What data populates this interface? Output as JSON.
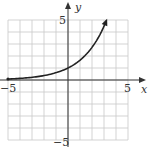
{
  "chart_data": {
    "type": "line",
    "title": "",
    "xlabel": "x",
    "ylabel": "y",
    "xlim": [
      -5,
      5
    ],
    "ylim": [
      -5,
      5
    ],
    "grid": true,
    "tick_labels": {
      "x": [
        "-5",
        "5"
      ],
      "y": [
        "5",
        "-5"
      ]
    },
    "series": [
      {
        "name": "f(x)",
        "function": "y = e^(x/2)",
        "x": [
          -5,
          -4,
          -3,
          -2,
          -1,
          0,
          1,
          2,
          3,
          3.2
        ],
        "y": [
          0.08,
          0.14,
          0.22,
          0.37,
          0.61,
          1.0,
          1.65,
          2.72,
          4.48,
          4.95
        ],
        "start_marker": "dot",
        "end_marker": "arrow"
      }
    ]
  },
  "labels": {
    "x_axis": "x",
    "y_axis": "y",
    "x_min": "−5",
    "x_max": "5",
    "y_max": "5",
    "y_min": "−5"
  }
}
